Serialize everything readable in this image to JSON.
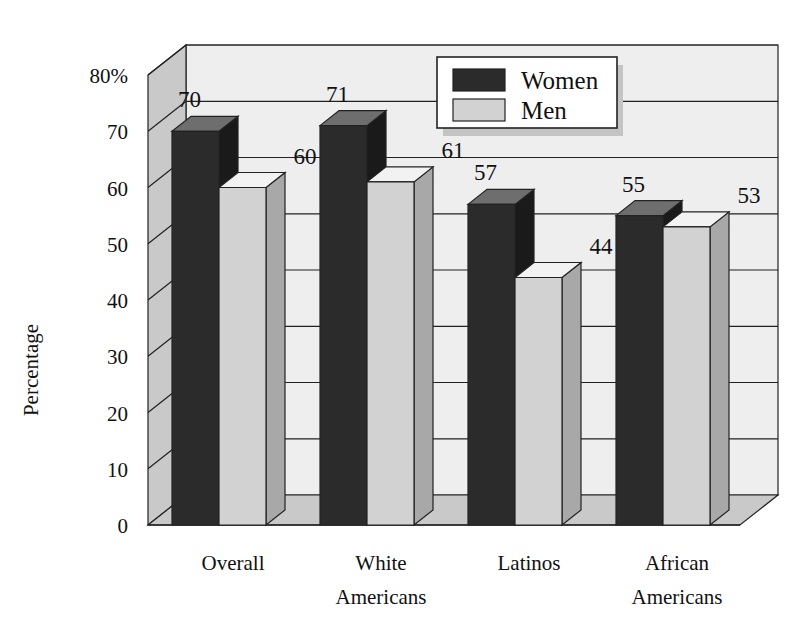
{
  "chart_data": {
    "type": "bar",
    "title": "",
    "subtitle": "",
    "xlabel": "",
    "ylabel": "Percentage",
    "categories": [
      "Overall",
      "White Americans",
      "Latinos",
      "African Americans"
    ],
    "category_lines": [
      [
        "Overall"
      ],
      [
        "White",
        "Americans"
      ],
      [
        "Latinos"
      ],
      [
        "African",
        "Americans"
      ]
    ],
    "series": [
      {
        "name": "Women",
        "values": [
          70,
          71,
          57,
          55
        ],
        "color": "#2b2b2b"
      },
      {
        "name": "Men",
        "values": [
          60,
          61,
          44,
          53
        ],
        "color": "#d2d2d2"
      }
    ],
    "ylim": [
      0,
      80
    ],
    "ytick_values": [
      0,
      10,
      20,
      30,
      40,
      50,
      60,
      70,
      80
    ],
    "ytick_labels": [
      "0",
      "10",
      "20",
      "30",
      "40",
      "50",
      "60",
      "70",
      "80%"
    ],
    "grid": true,
    "grid_orientation": "horizontal",
    "legend_position": "top-center",
    "style": "3d-bar",
    "data_labels": true
  },
  "legend": {
    "entries": [
      {
        "label": "Women",
        "swatch": "#2b2b2b"
      },
      {
        "label": "Men",
        "swatch": "#d2d2d2"
      }
    ]
  },
  "colors": {
    "women_front": "#2b2b2b",
    "women_top": "#6e6e6e",
    "women_side": "#1a1a1a",
    "men_front": "#d2d2d2",
    "men_top": "#f2f2f2",
    "men_side": "#a8a8a8",
    "back_wall": "#eeeeee",
    "left_wall": "#c9c9c9",
    "floor": "#c9c9c9",
    "shadow": "#c4c4c4",
    "outline": "#222222",
    "text": "#111111",
    "legend_bg": "#ffffff"
  }
}
